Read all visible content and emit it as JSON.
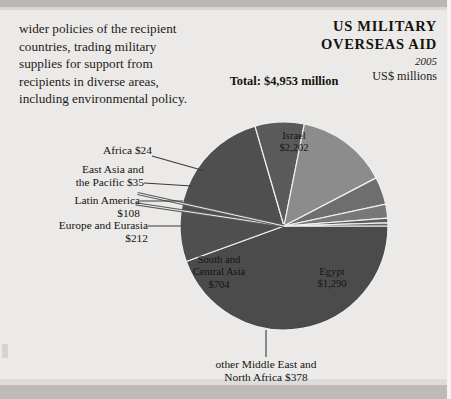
{
  "body_paragraph": {
    "lines": [
      "wider policies of the recipient",
      "countries, trading military",
      "supplies for support from",
      "recipients in diverse areas,",
      "including environmental policy."
    ]
  },
  "title": {
    "line1": "US MILITARY",
    "line2": "OVERSEAS AID",
    "year": "2005",
    "units": "US$ millions"
  },
  "total_label": "Total: $4,953 million",
  "chart_data": {
    "type": "pie",
    "title": "US MILITARY OVERSEAS AID",
    "subtitle": "2005",
    "units": "US$ millions",
    "total": 4953,
    "total_label": "Total: $4,953 million",
    "legend_position": "labels-on-and-around-slices",
    "grid": false,
    "categories": [
      "Israel",
      "Egypt",
      "other Middle East and North Africa",
      "South and Central Asia",
      "Europe and Eurasia",
      "Latin America",
      "East Asia and the Pacific",
      "Africa"
    ],
    "values": [
      2202,
      1290,
      378,
      704,
      212,
      108,
      35,
      24
    ],
    "value_labels": [
      "$2,202",
      "$1,290",
      "$378",
      "$704",
      "$212",
      "$108",
      "$35",
      "$24"
    ],
    "colors": [
      "#4b4b4b",
      "#4f4f4f",
      "#5a5a5a",
      "#8c8c8c",
      "#6e6e6e",
      "#787878",
      "#5d5d5d",
      "#656565"
    ],
    "start_angle_deg": 0,
    "direction": "clockwise",
    "center": [
      284,
      226
    ],
    "radius": 104
  },
  "slice_labels": [
    {
      "name": "Israel",
      "value": "$2,202"
    },
    {
      "name": "Egypt",
      "value": "$1,290"
    },
    {
      "name": "South and",
      "name2": "Central Asia",
      "value": "$704"
    }
  ],
  "callouts": {
    "africa": "Africa $24",
    "east_asia_l1": "East Asia and",
    "east_asia_l2": "the Pacific $35",
    "latin_l1": "Latin America",
    "latin_l2": "$108",
    "europe_l1": "Europe and Eurasia",
    "europe_l2": "$212",
    "other_mena_l1": "other Middle East and",
    "other_mena_l2": "North Africa $378"
  }
}
